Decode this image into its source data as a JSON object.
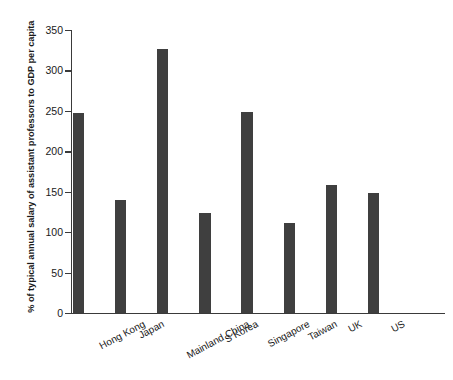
{
  "chart_data": {
    "type": "bar",
    "title": "",
    "xlabel": "",
    "ylabel": "% of typical annual salary of assistant professors to GDP per capita",
    "ylim": [
      0,
      350
    ],
    "yticks": [
      0,
      50,
      100,
      150,
      200,
      250,
      300,
      350
    ],
    "ytick_labels": [
      "0",
      "50",
      "100",
      "150",
      "200",
      "250",
      "300",
      "350"
    ],
    "grid": false,
    "legend": "none",
    "bar_color": "#3f3f3f",
    "axis_color": "#3a3a3a",
    "background": "#ffffff",
    "categories": [
      "Hong Kong",
      "Japan",
      "Mainland China",
      "S Korea",
      "Singapore",
      "Taiwan",
      "UK",
      "US"
    ],
    "values": [
      247,
      140,
      327,
      124,
      249,
      111,
      158,
      148
    ]
  }
}
